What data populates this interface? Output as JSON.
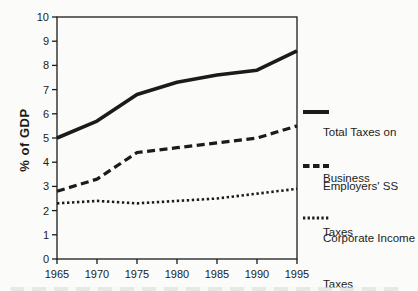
{
  "figure": {
    "background": "#fbfbf9",
    "ink_color": "#1b1b1b"
  },
  "chart_data": {
    "type": "line",
    "title": "",
    "xlabel": "",
    "ylabel": "% of GDP",
    "x": [
      1965,
      1970,
      1975,
      1980,
      1985,
      1990,
      1995
    ],
    "series": [
      {
        "name": "Total Taxes on Business",
        "style": "solid",
        "values": [
          5.0,
          5.7,
          6.8,
          7.3,
          7.6,
          7.8,
          8.6
        ]
      },
      {
        "name": "Employers' SS Taxes",
        "style": "dashed",
        "values": [
          2.8,
          3.3,
          4.4,
          4.6,
          4.8,
          5.0,
          5.5
        ]
      },
      {
        "name": "Corporate Income Taxes",
        "style": "dotted",
        "values": [
          2.3,
          2.4,
          2.3,
          2.4,
          2.5,
          2.7,
          2.9
        ]
      }
    ],
    "xlim": [
      1965,
      1995
    ],
    "ylim": [
      0,
      10
    ],
    "x_ticks": [
      1965,
      1970,
      1975,
      1980,
      1985,
      1990,
      1995
    ],
    "y_ticks": [
      0,
      1,
      2,
      3,
      4,
      5,
      6,
      7,
      8,
      9,
      10
    ],
    "grid": false,
    "legend_position": "right",
    "legend": [
      {
        "style": "solid",
        "line1": "Total Taxes on",
        "line2": "Business"
      },
      {
        "style": "dashed",
        "line1": "Employers' SS",
        "line2": "Taxes"
      },
      {
        "style": "dotted",
        "line1": "Corporate Income",
        "line2": "Taxes"
      }
    ]
  }
}
